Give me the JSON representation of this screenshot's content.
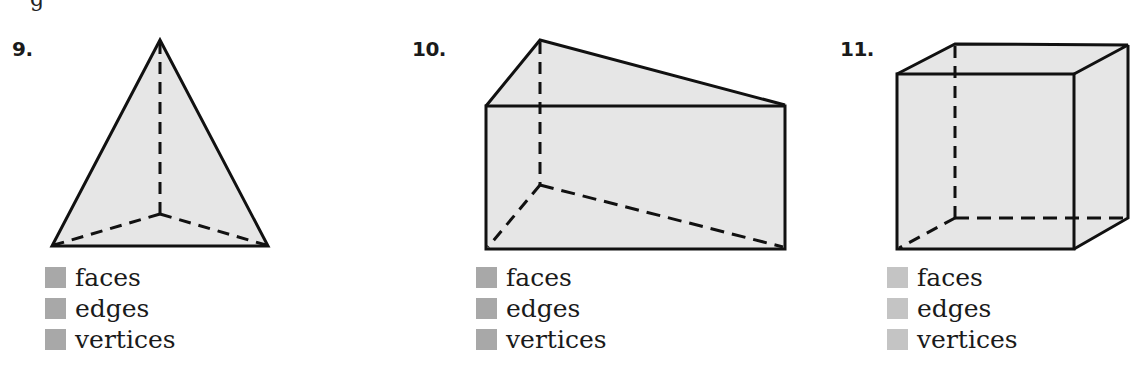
{
  "heading_fragment": "g",
  "problems": [
    {
      "number": "9.",
      "shape": "triangular pyramid",
      "answers": [
        {
          "label": "faces"
        },
        {
          "label": "edges"
        },
        {
          "label": "vertices"
        }
      ]
    },
    {
      "number": "10.",
      "shape": "triangular prism",
      "answers": [
        {
          "label": "faces"
        },
        {
          "label": "edges"
        },
        {
          "label": "vertices"
        }
      ]
    },
    {
      "number": "11.",
      "shape": "cube",
      "answers": [
        {
          "label": "faces"
        },
        {
          "label": "edges"
        },
        {
          "label": "vertices"
        }
      ]
    }
  ],
  "colors": {
    "face_fill": "#e6e6e6",
    "edge": "#111111",
    "answer_box_dark": "#a8a8a8",
    "answer_box_light": "#c4c4c4"
  }
}
